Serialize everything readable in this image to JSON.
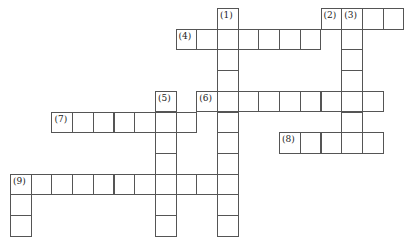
{
  "puzzle": {
    "type": "crossword",
    "grid": {
      "origin_x": 10,
      "origin_y": 8,
      "cell_size": 20.7,
      "line_color": "#555555"
    },
    "entries": [
      {
        "label": "(1)",
        "direction": "down",
        "row": 0,
        "col": 10,
        "length": 11
      },
      {
        "label": "(2)",
        "direction": "across",
        "row": 0,
        "col": 15,
        "length": 4
      },
      {
        "label": "(3)",
        "direction": "down",
        "row": 0,
        "col": 16,
        "length": 7
      },
      {
        "label": "(4)",
        "direction": "across",
        "row": 1,
        "col": 8,
        "length": 7
      },
      {
        "label": "(5)",
        "direction": "down",
        "row": 4,
        "col": 7,
        "length": 7
      },
      {
        "label": "(6)",
        "direction": "across",
        "row": 4,
        "col": 9,
        "length": 9
      },
      {
        "label": "(7)",
        "direction": "across",
        "row": 5,
        "col": 2,
        "length": 7
      },
      {
        "label": "(8)",
        "direction": "across",
        "row": 6,
        "col": 13,
        "length": 5
      },
      {
        "label": "(9)",
        "direction": "across",
        "row": 8,
        "col": 0,
        "length": 11
      },
      {
        "label": "",
        "direction": "down",
        "row": 8,
        "col": 0,
        "length": 3
      }
    ]
  }
}
